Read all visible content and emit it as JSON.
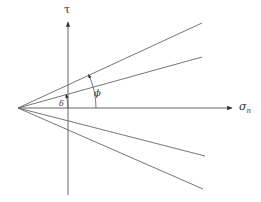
{
  "diagram": {
    "type": "Mohr-Coulomb failure envelope sketch",
    "axes": {
      "vertical_label": "τ",
      "horizontal_label_main": "σ",
      "horizontal_label_sub": "n"
    },
    "angles": {
      "phi_label": "ϕ",
      "delta_label": "δ"
    },
    "colors": {
      "line": "#555555",
      "background": "#ffffff"
    }
  }
}
